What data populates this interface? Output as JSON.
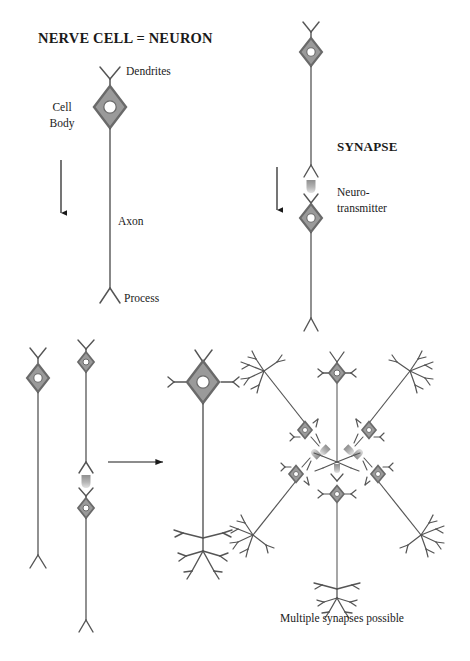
{
  "figure": {
    "title": "NERVE CELL = NEURON",
    "background_color": "#ffffff",
    "ink_color": "#1a1a1a"
  },
  "colors": {
    "soma_fill": "#9a9a9a",
    "soma_stroke": "#6a6a6a",
    "nucleus_fill": "#ffffff",
    "neuron_line": "#555555",
    "neurotransmitter_top": "#9a9a9a",
    "neurotransmitter_bottom": "#d8d8d8",
    "arrow_color": "#1a1a1a",
    "text_color": "#1a1a1a"
  },
  "panels": {
    "neuron_anatomy": {
      "title": "NERVE CELL = NEURON",
      "labels": {
        "dendrites": "Dendrites",
        "cell_body_line1": "Cell",
        "cell_body_line2": "Body",
        "axon": "Axon",
        "process": "Process"
      },
      "direction_arrow": "downward-arrow"
    },
    "synapse": {
      "title": "SYNAPSE",
      "labels": {
        "neurotransmitter_line1": "Neuro-",
        "neurotransmitter_line2": "transmitter"
      },
      "direction_arrow": "downward-arrow",
      "neuron_count": 2
    },
    "convergence": {
      "transform_arrow": "rightward-arrow",
      "source_neuron_count": 2,
      "result_neuron_count": 1
    },
    "network": {
      "caption": "Multiple synapses possible",
      "central_neuron_count": 2,
      "converging_neuron_count": 4,
      "synapse_count": 5
    }
  },
  "icons": {
    "soma": "diamond-cell-body-icon",
    "nucleus": "nucleus-icon",
    "dendrite": "dendrite-fork-icon",
    "axon": "axon-line-icon",
    "terminal": "axon-terminal-icon",
    "neurotransmitter": "neurotransmitter-blob-icon",
    "arrow_down": "arrow-down-icon",
    "arrow_right": "arrow-right-icon",
    "arbor": "dendritic-arbor-icon"
  }
}
